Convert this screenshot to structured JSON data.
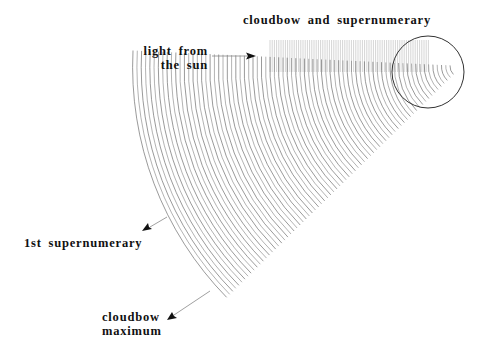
{
  "title": "cloudbow and supernumerary",
  "labels": {
    "light_line1": "light from",
    "light_line2": "the sun",
    "supernumerary": "1st supernumerary",
    "maximum_line1": "cloudbow",
    "maximum_line2": "maximum"
  },
  "geometry": {
    "droplet": {
      "cx": 428,
      "cy": 72,
      "r": 36
    },
    "wave_center": {
      "x": 462,
      "y": 66
    },
    "arc_count": 75,
    "arc_r_min": 12,
    "arc_r_max": 330,
    "incoming_x_start": 270,
    "incoming_x_end": 430,
    "incoming_y_top": 40,
    "incoming_y_bottom": 72
  },
  "colors": {
    "line": "#555555",
    "text": "#111111",
    "background": "#ffffff"
  }
}
